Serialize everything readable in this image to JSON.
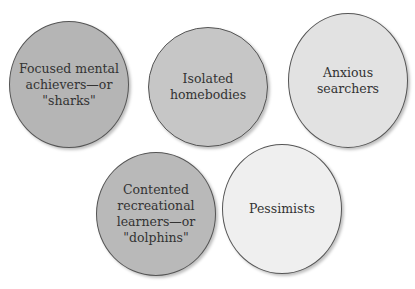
{
  "diagram": {
    "bubbles": [
      {
        "id": "sharks",
        "label": "Focused mental\nachievers—or\n\"sharks\"",
        "fill": "#b5b5b5",
        "left": 9,
        "top": 21,
        "width": 120,
        "height": 127
      },
      {
        "id": "homebodies",
        "label": "Isolated\nhomebodies",
        "fill": "#c6c6c6",
        "left": 148,
        "top": 27,
        "width": 120,
        "height": 120
      },
      {
        "id": "anxious",
        "label": "Anxious searchers",
        "fill": "#e2e2e2",
        "left": 288,
        "top": 13,
        "width": 120,
        "height": 135
      },
      {
        "id": "dolphins",
        "label": "Contented\nrecreational\nlearners—or\n\"dolphins\"",
        "fill": "#b9b9b9",
        "left": 96,
        "top": 152,
        "width": 120,
        "height": 124
      },
      {
        "id": "pessimists",
        "label": "Pessimists",
        "fill": "#efefef",
        "left": 222,
        "top": 144,
        "width": 120,
        "height": 130
      }
    ]
  }
}
